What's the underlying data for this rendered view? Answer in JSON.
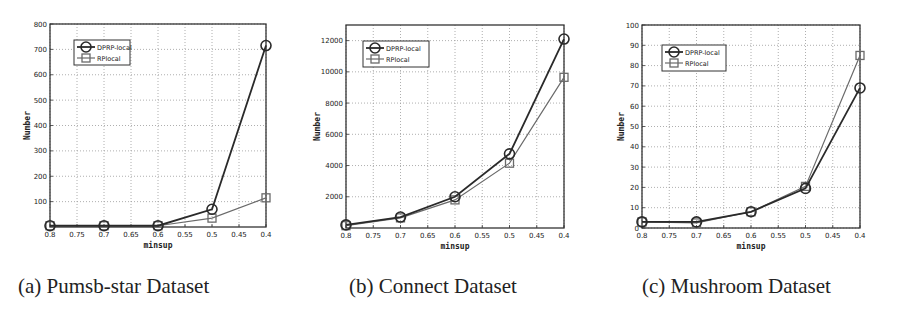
{
  "figure": {
    "captions": [
      "(a) Pumsb-star Dataset",
      "(b) Connect Dataset",
      "(c) Mushroom Dataset"
    ]
  },
  "colors": {
    "dprp_line": "#2a2a2a",
    "rp_line": "#6a6a6a",
    "axis": "#333333",
    "grid": "#9a9a9a",
    "text": "#222222"
  },
  "chart_data": [
    {
      "type": "line",
      "title": "(a) Pumsb-star Dataset",
      "xlabel": "minsup",
      "ylabel": "Number",
      "x": [
        0.8,
        0.7,
        0.6,
        0.5,
        0.4
      ],
      "xticks": [
        0.8,
        0.75,
        0.7,
        0.65,
        0.6,
        0.55,
        0.5,
        0.45,
        0.4
      ],
      "xtick_labels": [
        "0.8",
        "0.75",
        "0.7",
        "0.65",
        "0.6",
        "0.55",
        "0.5",
        "0.45",
        "0.4"
      ],
      "xlim": [
        0.8,
        0.4
      ],
      "ylim": [
        0,
        800
      ],
      "yticks": [
        100,
        200,
        300,
        400,
        500,
        600,
        700,
        800
      ],
      "grid": true,
      "legend_position": "upper left",
      "series": [
        {
          "name": "DPRP-local",
          "marker": "circle",
          "values": [
            5,
            5,
            5,
            70,
            715
          ]
        },
        {
          "name": "RPlocal",
          "marker": "square",
          "values": [
            5,
            5,
            5,
            35,
            115
          ]
        }
      ]
    },
    {
      "type": "line",
      "title": "(b) Connect Dataset",
      "xlabel": "minsup",
      "ylabel": "Number",
      "x": [
        0.8,
        0.7,
        0.6,
        0.5,
        0.4
      ],
      "xticks": [
        0.8,
        0.75,
        0.7,
        0.65,
        0.6,
        0.55,
        0.5,
        0.45,
        0.4
      ],
      "xtick_labels": [
        "0.8",
        "0.75",
        "0.7",
        "0.65",
        "0.6",
        "0.55",
        "0.5",
        "0.45",
        "0.4"
      ],
      "xlim": [
        0.8,
        0.4
      ],
      "ylim": [
        0,
        13000
      ],
      "yticks": [
        2000,
        4000,
        6000,
        8000,
        10000,
        12000
      ],
      "grid": true,
      "legend_position": "upper left",
      "series": [
        {
          "name": "DPRP-local",
          "marker": "circle",
          "values": [
            200,
            700,
            2000,
            4750,
            12100
          ]
        },
        {
          "name": "RPlocal",
          "marker": "square",
          "values": [
            150,
            650,
            1800,
            4150,
            9650
          ]
        }
      ]
    },
    {
      "type": "line",
      "title": "(c) Mushroom Dataset",
      "xlabel": "minsup",
      "ylabel": "Number",
      "x": [
        0.8,
        0.7,
        0.6,
        0.5,
        0.4
      ],
      "xticks": [
        0.8,
        0.75,
        0.7,
        0.65,
        0.6,
        0.55,
        0.5,
        0.45,
        0.4
      ],
      "xtick_labels": [
        "0.8",
        "0.75",
        "0.7",
        "0.65",
        "0.6",
        "0.55",
        "0.5",
        "0.45",
        "0.4"
      ],
      "xlim": [
        0.8,
        0.4
      ],
      "ylim": [
        0,
        100
      ],
      "yticks": [
        0,
        10,
        20,
        30,
        40,
        50,
        60,
        70,
        80,
        90,
        100
      ],
      "grid": true,
      "legend_position": "upper left",
      "series": [
        {
          "name": "DPRP-local",
          "marker": "circle",
          "values": [
            3,
            3,
            8,
            19.5,
            69
          ]
        },
        {
          "name": "RPlocal",
          "marker": "square",
          "values": [
            3,
            2.5,
            8,
            20.5,
            85
          ]
        }
      ]
    }
  ]
}
